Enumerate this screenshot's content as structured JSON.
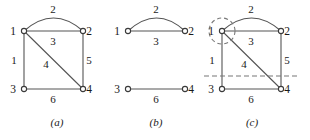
{
  "figure": {
    "width": 310,
    "height": 140,
    "background": "#ffffff",
    "ink": "#555555",
    "dash_color": "#777777"
  },
  "panels": [
    {
      "id": "a",
      "caption": "(a)",
      "caption_x": 57,
      "caption_y": 126,
      "vertices": [
        {
          "id": "1",
          "label": "1",
          "x": 24,
          "y": 31,
          "label_x": 13,
          "label_y": 35
        },
        {
          "id": "2",
          "label": "2",
          "x": 83,
          "y": 31,
          "label_x": 89,
          "label_y": 35
        },
        {
          "id": "3",
          "label": "3",
          "x": 24,
          "y": 89,
          "label_x": 13,
          "label_y": 93
        },
        {
          "id": "4",
          "label": "4",
          "x": 83,
          "y": 89,
          "label_x": 89,
          "label_y": 93
        }
      ],
      "edges": [
        {
          "label": "2",
          "kind": "arc",
          "from": "1",
          "to": "2",
          "bow": 13,
          "label_x": 53,
          "label_y": 13
        },
        {
          "label": "3",
          "kind": "line",
          "from": "1",
          "to": "2",
          "label_x": 53,
          "label_y": 45
        },
        {
          "label": "1",
          "kind": "line",
          "from": "1",
          "to": "3",
          "label_x": 14,
          "label_y": 64
        },
        {
          "label": "5",
          "kind": "line",
          "from": "2",
          "to": "4",
          "label_x": 89,
          "label_y": 64
        },
        {
          "label": "4",
          "kind": "line",
          "from": "1",
          "to": "4",
          "label_x": 46,
          "label_y": 68
        },
        {
          "label": "6",
          "kind": "line",
          "from": "3",
          "to": "4",
          "label_x": 53,
          "label_y": 103
        }
      ],
      "cuts": []
    },
    {
      "id": "b",
      "caption": "(b)",
      "caption_x": 156,
      "caption_y": 126,
      "vertices": [
        {
          "id": "1",
          "label": "1",
          "x": 128,
          "y": 31,
          "label_x": 117,
          "label_y": 35
        },
        {
          "id": "2",
          "label": "2",
          "x": 185,
          "y": 31,
          "label_x": 191,
          "label_y": 35
        },
        {
          "id": "3",
          "label": "3",
          "x": 128,
          "y": 89,
          "label_x": 117,
          "label_y": 93
        },
        {
          "id": "4",
          "label": "4",
          "x": 185,
          "y": 89,
          "label_x": 191,
          "label_y": 93
        }
      ],
      "edges": [
        {
          "label": "2",
          "kind": "arc",
          "from": "1",
          "to": "2",
          "bow": 13,
          "label_x": 156,
          "label_y": 13
        },
        {
          "label": "3",
          "kind": "line",
          "from": "1",
          "to": "2",
          "label_x": 156,
          "label_y": 45
        },
        {
          "label": "6",
          "kind": "line",
          "from": "3",
          "to": "4",
          "label_x": 156,
          "label_y": 103
        }
      ],
      "cuts": []
    },
    {
      "id": "c",
      "caption": "(c)",
      "caption_x": 252,
      "caption_y": 126,
      "vertices": [
        {
          "id": "1",
          "label": "1",
          "x": 222,
          "y": 31,
          "label_x": 211,
          "label_y": 35
        },
        {
          "id": "2",
          "label": "2",
          "x": 281,
          "y": 31,
          "label_x": 287,
          "label_y": 35
        },
        {
          "id": "3",
          "label": "3",
          "x": 222,
          "y": 89,
          "label_x": 211,
          "label_y": 93
        },
        {
          "id": "4",
          "label": "4",
          "x": 281,
          "y": 89,
          "label_x": 287,
          "label_y": 93
        }
      ],
      "edges": [
        {
          "label": "2",
          "kind": "arc",
          "from": "1",
          "to": "2",
          "bow": 13,
          "label_x": 251,
          "label_y": 13
        },
        {
          "label": "3",
          "kind": "line",
          "from": "1",
          "to": "2",
          "label_x": 251,
          "label_y": 45
        },
        {
          "label": "1",
          "kind": "line",
          "from": "1",
          "to": "3",
          "label_x": 212,
          "label_y": 64
        },
        {
          "label": "5",
          "kind": "line",
          "from": "2",
          "to": "4",
          "label_x": 287,
          "label_y": 64
        },
        {
          "label": "4",
          "kind": "line",
          "from": "1",
          "to": "4",
          "label_x": 244,
          "label_y": 68
        },
        {
          "label": "6",
          "kind": "line",
          "from": "3",
          "to": "4",
          "label_x": 251,
          "label_y": 103
        }
      ],
      "cuts": [
        {
          "kind": "circle",
          "name": "vertex-1-cut",
          "cx": 222,
          "cy": 31,
          "r": 13
        },
        {
          "kind": "hline",
          "name": "horizontal-cut",
          "x1": 204,
          "x2": 300,
          "y": 76
        }
      ]
    }
  ]
}
